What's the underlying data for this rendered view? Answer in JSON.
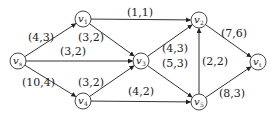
{
  "diagram": {
    "type": "flow-network",
    "nodes": [
      {
        "id": "vs",
        "label": "v",
        "sub": "s",
        "x": 18,
        "y": 61
      },
      {
        "id": "v1",
        "label": "v",
        "sub": "1",
        "x": 83,
        "y": 19
      },
      {
        "id": "v3",
        "label": "v",
        "sub": "3",
        "x": 141,
        "y": 61
      },
      {
        "id": "v4",
        "label": "v",
        "sub": "4",
        "x": 83,
        "y": 101
      },
      {
        "id": "v2",
        "label": "v",
        "sub": "2",
        "x": 199,
        "y": 20
      },
      {
        "id": "v5",
        "label": "v",
        "sub": "5",
        "x": 199,
        "y": 102
      },
      {
        "id": "vt",
        "label": "v",
        "sub": "t",
        "x": 258,
        "y": 62
      }
    ],
    "edges": [
      {
        "from": "vs",
        "to": "v1",
        "label": "(4,3)",
        "lx": 28,
        "ly": 41
      },
      {
        "from": "vs",
        "to": "v3",
        "label": "(3,2)",
        "lx": 60,
        "ly": 55
      },
      {
        "from": "vs",
        "to": "v4",
        "label": "(10,4)",
        "lx": 22,
        "ly": 86
      },
      {
        "from": "v1",
        "label": "(3,2)",
        "to": "v3",
        "lx": 78,
        "ly": 41
      },
      {
        "from": "v1",
        "to": "v2",
        "label": "(1,1)",
        "lx": 127,
        "ly": 16
      },
      {
        "from": "v4",
        "to": "v3",
        "label": "(3,2)",
        "lx": 78,
        "ly": 86
      },
      {
        "from": "v4",
        "to": "v5",
        "label": "(4,2)",
        "lx": 128,
        "ly": 95
      },
      {
        "from": "v3",
        "to": "v2",
        "label": "(4,3)",
        "lx": 162,
        "ly": 52
      },
      {
        "from": "v3",
        "to": "v5",
        "label": "(5,3)",
        "lx": 162,
        "ly": 67
      },
      {
        "from": "v5",
        "to": "v2",
        "label": "(2,2)",
        "lx": 202,
        "ly": 65
      },
      {
        "from": "v2",
        "to": "vt",
        "label": "(7,6)",
        "lx": 221,
        "ly": 37
      },
      {
        "from": "v5",
        "to": "vt",
        "label": "(8,3)",
        "lx": 219,
        "ly": 97
      }
    ]
  },
  "colors": {
    "stroke": "#333333",
    "text": "#222222",
    "background": "#ffffff"
  }
}
